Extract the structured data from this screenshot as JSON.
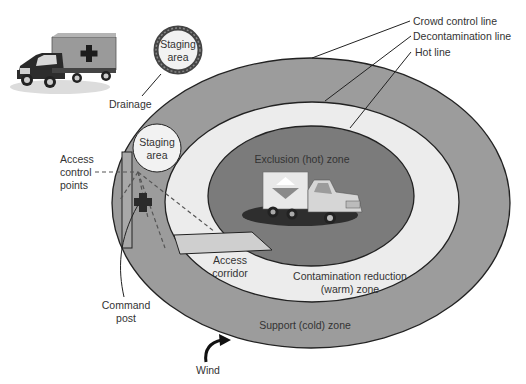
{
  "diagram": {
    "colors": {
      "support_zone": "#9c9c9c",
      "warm_zone": "#ececec",
      "hot_zone": "#7b7b7b",
      "outline": "#222222",
      "text": "#333333",
      "staging_fill": "#f2f2f2",
      "corridor_fill": "#cfcfcf",
      "cross": "#2a2a2a"
    },
    "zones": {
      "hot": "Exclusion (hot) zone",
      "warm_line1": "Contamination reduction",
      "warm_line2": "(warm) zone",
      "cold": "Support (cold) zone"
    },
    "lines": {
      "crowd_control": "Crowd control line",
      "decontamination": "Decontamination line",
      "hot": "Hot line"
    },
    "labels": {
      "staging_top_line1": "Staging",
      "staging_top_line2": "area",
      "staging_inner_line1": "Staging",
      "staging_inner_line2": "area",
      "drainage": "Drainage",
      "access_control_line1": "Access",
      "access_control_line2": "control",
      "access_control_line3": "points",
      "access_corridor_line1": "Access",
      "access_corridor_line2": "corridor",
      "command_post_line1": "Command",
      "command_post_line2": "post",
      "wind": "Wind"
    },
    "icons": {
      "ambulance": "ambulance-truck-icon",
      "hazmat_truck": "hazmat-truck-icon",
      "command_post_cross": "medical-cross-icon",
      "wind_arrow": "curved-arrow-icon"
    }
  }
}
